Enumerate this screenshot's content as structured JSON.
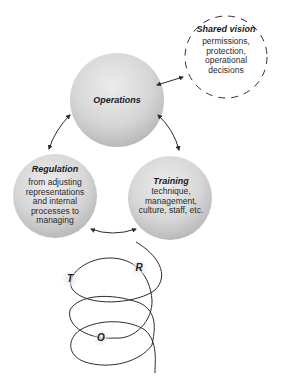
{
  "diagram": {
    "nodes": [
      {
        "id": "operations",
        "title": "Operations",
        "body": ""
      },
      {
        "id": "shared_vision",
        "title": "Shared vision",
        "body_lines": [
          "permissions,",
          "protection,",
          "operational",
          "decisions"
        ]
      },
      {
        "id": "regulation",
        "title": "Regulation",
        "body_lines": [
          "from adjusting",
          "representations",
          "and internal",
          "processes to",
          "managing"
        ]
      },
      {
        "id": "training",
        "title": "Training",
        "body_lines": [
          "technique,",
          "management,",
          "culture, staff, etc."
        ]
      }
    ],
    "edges": [
      {
        "from": "operations",
        "to": "shared_vision",
        "type": "bidirectional"
      },
      {
        "from": "operations",
        "to": "regulation",
        "type": "bidirectional"
      },
      {
        "from": "operations",
        "to": "training",
        "type": "bidirectional"
      },
      {
        "from": "regulation",
        "to": "training",
        "type": "bidirectional"
      }
    ],
    "helix": {
      "labels": [
        "T",
        "R",
        "O"
      ]
    },
    "colors": {
      "sphere_light": "#e6e6e6",
      "sphere_dark": "#a9a9a9",
      "line": "#2b2b2b",
      "dashed": "#333333"
    }
  }
}
